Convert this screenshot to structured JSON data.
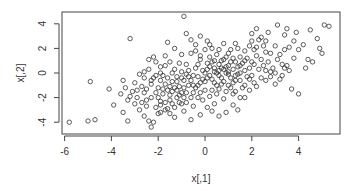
{
  "chart_data": {
    "type": "scatter",
    "title": "",
    "xlabel": "x[,1]",
    "ylabel": "x[,2]",
    "xlim": [
      -6.1,
      5.8
    ],
    "ylim": [
      -4.9,
      4.9
    ],
    "xticks": [
      -6,
      -4,
      -2,
      0,
      2,
      4
    ],
    "yticks": [
      -4,
      -2,
      0,
      2,
      4
    ],
    "grid": false,
    "legend": null,
    "marker": "open-circle",
    "marker_color": "#333333",
    "n_points_approx": 500,
    "points": [
      [
        -5.8,
        -4.0
      ],
      [
        -5.0,
        -3.9
      ],
      [
        -4.7,
        -3.8
      ],
      [
        -4.9,
        -0.7
      ],
      [
        -4.1,
        -1.3
      ],
      [
        -3.2,
        2.8
      ],
      [
        -3.5,
        -0.6
      ],
      [
        -3.9,
        -2.6
      ],
      [
        -3.5,
        -3.2
      ],
      [
        -3.3,
        -3.9
      ],
      [
        -3.0,
        -0.8
      ],
      [
        -2.9,
        -1.4
      ],
      [
        -2.6,
        -3.5
      ],
      [
        -2.5,
        -2.2
      ],
      [
        -2.4,
        -3.9
      ],
      [
        -2.3,
        -4.4
      ],
      [
        -2.2,
        -4.0
      ],
      [
        -2.0,
        -3.3
      ],
      [
        -1.9,
        -2.6
      ],
      [
        -1.8,
        -1.7
      ],
      [
        -3.6,
        -1.7
      ],
      [
        -3.2,
        -1.9
      ],
      [
        -3.0,
        -2.5
      ],
      [
        -2.8,
        -3.0
      ],
      [
        -2.7,
        -1.1
      ],
      [
        -2.6,
        -0.4
      ],
      [
        -2.4,
        0.3
      ],
      [
        -2.3,
        -0.9
      ],
      [
        -2.1,
        0.9
      ],
      [
        -2.0,
        -1.2
      ],
      [
        -1.9,
        0.5
      ],
      [
        -1.8,
        -0.2
      ],
      [
        -1.7,
        -0.9
      ],
      [
        -1.6,
        -2.9
      ],
      [
        -1.5,
        -2.2
      ],
      [
        -1.4,
        -1.5
      ],
      [
        -1.3,
        -3.6
      ],
      [
        -1.2,
        -0.7
      ],
      [
        -1.1,
        0.8
      ],
      [
        -1.0,
        -1.6
      ],
      [
        -0.9,
        -3.1
      ],
      [
        -0.8,
        -2.4
      ],
      [
        -0.7,
        -0.3
      ],
      [
        -0.6,
        1.6
      ],
      [
        -0.5,
        -1.0
      ],
      [
        -0.4,
        0.4
      ],
      [
        -0.3,
        -2.0
      ],
      [
        -0.2,
        1.1
      ],
      [
        -0.1,
        -0.5
      ],
      [
        0.0,
        -1.4
      ],
      [
        -1.6,
        2.5
      ],
      [
        -1.3,
        2.0
      ],
      [
        -1.0,
        1.5
      ],
      [
        -0.8,
        3.2
      ],
      [
        -0.6,
        2.7
      ],
      [
        -0.4,
        2.3
      ],
      [
        -0.2,
        3.0
      ],
      [
        0.1,
        2.6
      ],
      [
        0.3,
        2.0
      ],
      [
        -0.9,
        4.6
      ],
      [
        -2.2,
        1.3
      ],
      [
        -2.4,
        1.1
      ],
      [
        -2.6,
        0.1
      ],
      [
        -2.8,
        -0.1
      ],
      [
        -1.7,
        1.4
      ],
      [
        -1.5,
        0.9
      ],
      [
        -1.3,
        0.3
      ],
      [
        -1.2,
        -0.3
      ],
      [
        -1.0,
        0.1
      ],
      [
        -0.8,
        0.7
      ],
      [
        0.1,
        0.3
      ],
      [
        0.2,
        -0.2
      ],
      [
        0.3,
        0.9
      ],
      [
        0.4,
        -0.8
      ],
      [
        0.5,
        1.5
      ],
      [
        0.6,
        0.2
      ],
      [
        0.7,
        -0.4
      ],
      [
        0.8,
        1.1
      ],
      [
        0.9,
        0.5
      ],
      [
        1.0,
        -0.1
      ],
      [
        0.2,
        -1.9
      ],
      [
        0.4,
        -2.5
      ],
      [
        0.6,
        -1.3
      ],
      [
        0.8,
        -2.1
      ],
      [
        1.0,
        -1.0
      ],
      [
        1.2,
        -1.7
      ],
      [
        1.3,
        -0.6
      ],
      [
        1.5,
        0.0
      ],
      [
        1.6,
        -1.2
      ],
      [
        1.8,
        -0.3
      ],
      [
        1.1,
        1.9
      ],
      [
        1.3,
        2.4
      ],
      [
        1.5,
        1.3
      ],
      [
        1.7,
        1.8
      ],
      [
        1.9,
        2.2
      ],
      [
        2.0,
        0.9
      ],
      [
        2.2,
        1.4
      ],
      [
        2.3,
        2.7
      ],
      [
        2.5,
        0.6
      ],
      [
        2.6,
        1.7
      ],
      [
        2.0,
        3.2
      ],
      [
        2.2,
        3.6
      ],
      [
        2.4,
        2.9
      ],
      [
        2.7,
        3.3
      ],
      [
        3.0,
        2.2
      ],
      [
        3.2,
        1.5
      ],
      [
        3.4,
        3.1
      ],
      [
        3.6,
        2.1
      ],
      [
        3.8,
        2.6
      ],
      [
        4.0,
        1.9
      ],
      [
        3.1,
        3.9
      ],
      [
        3.5,
        3.6
      ],
      [
        3.9,
        3.3
      ],
      [
        4.2,
        2.3
      ],
      [
        4.4,
        1.1
      ],
      [
        4.5,
        3.5
      ],
      [
        4.8,
        2.8
      ],
      [
        5.0,
        1.6
      ],
      [
        5.1,
        3.9
      ],
      [
        5.3,
        3.8
      ],
      [
        2.6,
        -0.6
      ],
      [
        2.8,
        0.1
      ],
      [
        3.0,
        -0.9
      ],
      [
        3.3,
        -0.2
      ],
      [
        3.5,
        0.6
      ],
      [
        3.7,
        -1.3
      ],
      [
        4.0,
        -1.7
      ],
      [
        4.3,
        0.4
      ],
      [
        4.6,
        0.9
      ],
      [
        4.9,
        2.0
      ],
      [
        1.2,
        -2.6
      ],
      [
        1.4,
        -3.0
      ],
      [
        0.9,
        -3.2
      ],
      [
        0.6,
        -3.5
      ],
      [
        0.3,
        -3.1
      ],
      [
        0.1,
        -2.8
      ],
      [
        -0.2,
        -3.4
      ],
      [
        -0.5,
        -2.7
      ],
      [
        -0.6,
        -3.8
      ],
      [
        1.7,
        -2.0
      ],
      [
        -1.5,
        -1.1
      ],
      [
        -1.4,
        0.0
      ],
      [
        -1.1,
        -1.1
      ],
      [
        -0.9,
        -0.6
      ],
      [
        -0.7,
        0.2
      ],
      [
        -0.5,
        -0.2
      ],
      [
        -0.3,
        0.7
      ],
      [
        -0.2,
        -0.8
      ],
      [
        0.0,
        0.0
      ],
      [
        0.1,
        0.8
      ],
      [
        0.2,
        1.3
      ],
      [
        0.3,
        -0.5
      ],
      [
        0.4,
        0.4
      ],
      [
        0.5,
        -1.0
      ],
      [
        0.6,
        0.7
      ],
      [
        0.7,
        1.0
      ],
      [
        0.8,
        -0.7
      ],
      [
        0.9,
        0.0
      ],
      [
        1.0,
        0.6
      ],
      [
        1.1,
        -0.4
      ],
      [
        1.2,
        0.3
      ],
      [
        1.3,
        0.9
      ],
      [
        1.4,
        0.5
      ],
      [
        1.5,
        -0.6
      ],
      [
        1.6,
        0.8
      ],
      [
        1.7,
        0.2
      ],
      [
        1.8,
        1.2
      ],
      [
        1.9,
        0.4
      ],
      [
        2.0,
        -0.2
      ],
      [
        2.1,
        0.7
      ],
      [
        -2.0,
        -2.0
      ],
      [
        -1.9,
        -0.6
      ],
      [
        -1.8,
        -1.3
      ],
      [
        -1.6,
        -0.4
      ],
      [
        -1.5,
        -1.8
      ],
      [
        -1.4,
        -2.5
      ],
      [
        -1.3,
        -1.2
      ],
      [
        -1.2,
        -2.0
      ],
      [
        -1.1,
        -1.8
      ],
      [
        -1.0,
        -2.5
      ],
      [
        -0.9,
        -1.2
      ],
      [
        -0.8,
        -1.6
      ],
      [
        -0.7,
        -1.0
      ],
      [
        -0.6,
        -2.0
      ],
      [
        -0.5,
        -1.6
      ],
      [
        -0.4,
        -1.2
      ],
      [
        -0.3,
        -1.0
      ],
      [
        -0.2,
        -1.6
      ],
      [
        -0.1,
        -2.2
      ],
      [
        0.0,
        -0.7
      ],
      [
        -2.2,
        -0.4
      ],
      [
        -2.1,
        -1.6
      ],
      [
        -1.9,
        -2.3
      ],
      [
        -1.7,
        -2.4
      ],
      [
        -1.6,
        -1.4
      ],
      [
        -1.4,
        -0.7
      ],
      [
        -1.2,
        -1.4
      ],
      [
        -1.0,
        -0.4
      ],
      [
        -0.8,
        -0.1
      ],
      [
        -0.6,
        -0.6
      ],
      [
        0.5,
        0.0
      ],
      [
        0.7,
        0.4
      ],
      [
        0.9,
        1.3
      ],
      [
        1.1,
        0.9
      ],
      [
        1.3,
        -0.2
      ],
      [
        1.5,
        0.6
      ],
      [
        1.7,
        1.0
      ],
      [
        1.9,
        -0.5
      ],
      [
        2.1,
        1.9
      ],
      [
        2.3,
        0.3
      ],
      [
        2.4,
        1.1
      ],
      [
        2.5,
        2.2
      ],
      [
        2.7,
        0.9
      ],
      [
        2.8,
        1.6
      ],
      [
        2.9,
        0.4
      ],
      [
        3.1,
        1.1
      ],
      [
        3.3,
        0.7
      ],
      [
        3.4,
        1.9
      ],
      [
        3.6,
        0.2
      ],
      [
        3.8,
        1.2
      ],
      [
        -0.4,
        1.8
      ],
      [
        -0.2,
        1.4
      ],
      [
        0.0,
        1.9
      ],
      [
        0.2,
        2.3
      ],
      [
        0.4,
        1.0
      ],
      [
        0.6,
        1.9
      ],
      [
        0.8,
        2.4
      ],
      [
        1.0,
        1.6
      ],
      [
        1.2,
        1.2
      ],
      [
        1.4,
        2.0
      ],
      [
        -2.6,
        -1.6
      ],
      [
        -2.5,
        -2.7
      ],
      [
        -2.3,
        -2.0
      ],
      [
        -2.1,
        -2.8
      ],
      [
        -1.9,
        -3.2
      ],
      [
        -1.7,
        -3.0
      ],
      [
        -1.5,
        -3.3
      ],
      [
        -1.3,
        -2.8
      ],
      [
        -1.1,
        -2.4
      ],
      [
        -0.9,
        -2.0
      ],
      [
        -3.4,
        -1.2
      ],
      [
        -3.3,
        -2.2
      ],
      [
        -3.1,
        -1.5
      ],
      [
        -2.9,
        -2.0
      ],
      [
        -2.7,
        -2.4
      ],
      [
        -2.5,
        -1.3
      ],
      [
        -2.3,
        -0.6
      ],
      [
        -2.1,
        -0.2
      ],
      [
        -1.9,
        0.0
      ],
      [
        -1.7,
        0.6
      ],
      [
        0.3,
        -1.4
      ],
      [
        0.5,
        -1.7
      ],
      [
        0.7,
        -0.9
      ],
      [
        0.9,
        -1.5
      ],
      [
        1.1,
        -1.2
      ],
      [
        1.3,
        -1.5
      ],
      [
        1.5,
        -2.0
      ],
      [
        1.7,
        -1.0
      ],
      [
        1.9,
        -1.4
      ],
      [
        2.1,
        -0.8
      ],
      [
        -0.3,
        -0.3
      ],
      [
        -0.1,
        0.2
      ],
      [
        0.1,
        -0.4
      ],
      [
        0.2,
        0.5
      ],
      [
        0.4,
        0.1
      ],
      [
        0.6,
        -0.2
      ],
      [
        0.8,
        0.3
      ],
      [
        1.0,
        0.1
      ],
      [
        1.2,
        -0.8
      ],
      [
        1.4,
        -0.1
      ],
      [
        2.2,
        -1.1
      ],
      [
        2.4,
        -0.4
      ],
      [
        2.6,
        0.2
      ],
      [
        2.8,
        -0.3
      ],
      [
        3.0,
        0.0
      ],
      [
        3.2,
        -0.5
      ],
      [
        3.4,
        0.4
      ],
      [
        2.0,
        2.6
      ],
      [
        2.2,
        2.1
      ],
      [
        2.6,
        2.6
      ]
    ]
  }
}
